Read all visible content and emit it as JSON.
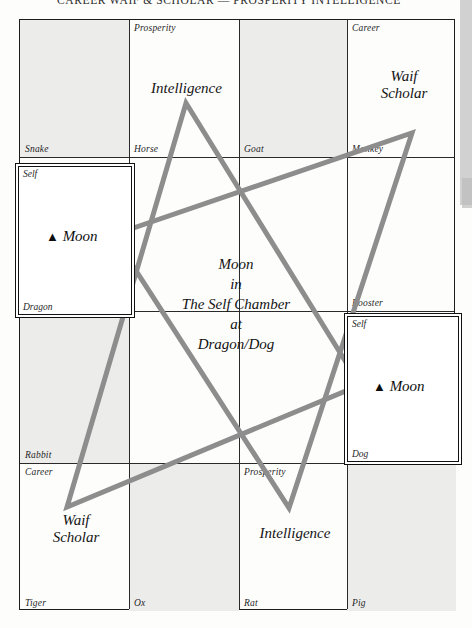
{
  "header": {
    "running_head": "CAREER WAIF & SCHOLAR — PROSPERITY INTELLIGENCE"
  },
  "chart_data": {
    "type": "diagram",
    "title": "Moon in The Self Chamber at Dragon/Dog",
    "grid_rows": 4,
    "grid_cols": 4,
    "cells": [
      {
        "branch": "Snake",
        "palace": "",
        "annotation": "",
        "shaded": true,
        "row": 0,
        "col": 0
      },
      {
        "branch": "Horse",
        "palace": "Prosperity",
        "annotation": "Intelligence",
        "shaded": false,
        "row": 0,
        "col": 1
      },
      {
        "branch": "Goat",
        "palace": "",
        "annotation": "",
        "shaded": true,
        "row": 0,
        "col": 2
      },
      {
        "branch": "Monkey",
        "palace": "Career",
        "annotation": "Waif\nScholar",
        "shaded": false,
        "row": 0,
        "col": 3
      },
      {
        "branch": "Dragon",
        "palace": "Self",
        "annotation": "",
        "shaded": false,
        "row": 1,
        "col": 0
      },
      {
        "branch": "",
        "palace": "",
        "annotation": "",
        "shaded": false,
        "row": 1,
        "col": 1
      },
      {
        "branch": "",
        "palace": "",
        "annotation": "",
        "shaded": false,
        "row": 1,
        "col": 2
      },
      {
        "branch": "Rooster",
        "palace": "",
        "annotation": "",
        "shaded": false,
        "row": 1,
        "col": 3
      },
      {
        "branch": "Rabbit",
        "palace": "",
        "annotation": "",
        "shaded": true,
        "row": 2,
        "col": 0
      },
      {
        "branch": "",
        "palace": "",
        "annotation": "",
        "shaded": false,
        "row": 2,
        "col": 1
      },
      {
        "branch": "",
        "palace": "",
        "annotation": "",
        "shaded": false,
        "row": 2,
        "col": 2
      },
      {
        "branch": "Dog",
        "palace": "Self",
        "annotation": "",
        "shaded": false,
        "row": 2,
        "col": 3
      },
      {
        "branch": "Tiger",
        "palace": "Career",
        "annotation": "Waif\nScholar",
        "shaded": false,
        "row": 3,
        "col": 0
      },
      {
        "branch": "Ox",
        "palace": "",
        "annotation": "",
        "shaded": true,
        "row": 3,
        "col": 1
      },
      {
        "branch": "Rat",
        "palace": "Prosperity",
        "annotation": "Intelligence",
        "shaded": false,
        "row": 3,
        "col": 2
      },
      {
        "branch": "Pig",
        "palace": "",
        "annotation": "",
        "shaded": true,
        "row": 3,
        "col": 3
      }
    ],
    "star_vertices": [
      [
        186,
        103
      ],
      [
        412,
        133
      ],
      [
        360,
        385
      ],
      [
        289,
        508
      ],
      [
        67,
        507
      ],
      [
        113,
        235
      ]
    ],
    "star_color": "#8d8d8d",
    "star_stroke_width": 5
  },
  "branches": {
    "snake": "Snake",
    "horse": "Horse",
    "goat": "Goat",
    "monkey": "Monkey",
    "dragon": "Dragon",
    "rooster": "Rooster",
    "rabbit": "Rabbit",
    "dog": "Dog",
    "tiger": "Tiger",
    "ox": "Ox",
    "rat": "Rat",
    "pig": "Pig"
  },
  "palaces": {
    "prosperity_top": "Prosperity",
    "career_top": "Career",
    "career_bottom": "Career",
    "prosperity_bottom": "Prosperity",
    "self_left": "Self",
    "self_right": "Self"
  },
  "annotations": {
    "intelligence_top": "Intelligence",
    "waif_scholar_top_line1": "Waif",
    "waif_scholar_top_line2": "Scholar",
    "waif_scholar_bottom_line1": "Waif",
    "waif_scholar_bottom_line2": "Scholar",
    "intelligence_bottom": "Intelligence"
  },
  "markers": {
    "triangle_glyph": "▲",
    "moon_left": "Moon",
    "moon_right": "Moon"
  },
  "caption": {
    "line1": "Moon",
    "line2": "in",
    "line3": "The Self Chamber",
    "line4": "at",
    "line5": "Dragon/Dog"
  },
  "colors": {
    "ink": "#1d1d1d",
    "shade": "#ececeb",
    "star": "#8d8d8d",
    "scan_artifact": "#c9c9c9"
  }
}
